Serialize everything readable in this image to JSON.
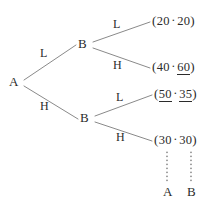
{
  "figure": {
    "type": "extensive-form-game-tree",
    "separator": "·",
    "open_paren": "(",
    "close_paren": ")"
  },
  "nodes": {
    "root": {
      "label": "A"
    },
    "upper": {
      "label": "B"
    },
    "lower": {
      "label": "B"
    }
  },
  "branches": {
    "root_up": {
      "label": "L"
    },
    "root_down": {
      "label": "H"
    },
    "upper_up": {
      "label": "L"
    },
    "upper_down": {
      "label": "H"
    },
    "lower_up": {
      "label": "L"
    },
    "lower_down": {
      "label": "H"
    }
  },
  "payoffs": [
    {
      "a": "20",
      "b": "20",
      "a_underlined": false,
      "b_underlined": false
    },
    {
      "a": "40",
      "b": "60",
      "a_underlined": false,
      "b_underlined": true
    },
    {
      "a": "50",
      "b": "35",
      "a_underlined": true,
      "b_underlined": true
    },
    {
      "a": "30",
      "b": "30",
      "a_underlined": false,
      "b_underlined": false
    }
  ],
  "player_columns": {
    "left": "A",
    "right": "B"
  }
}
